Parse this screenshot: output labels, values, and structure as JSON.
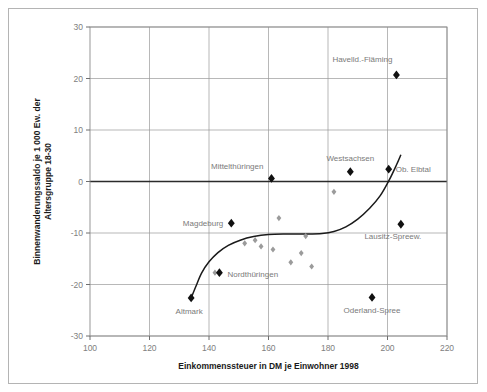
{
  "chart_data": {
    "type": "scatter",
    "title": "",
    "xlabel": "Einkommenssteuer in DM je Einwohner 1998",
    "ylabel": "Binnenwanderungssaldo je 1 000 Ew. der Altersgruppe 18-30",
    "xlim": [
      100,
      220
    ],
    "ylim": [
      -30,
      30
    ],
    "xticks": [
      100,
      120,
      140,
      160,
      180,
      200,
      220
    ],
    "yticks": [
      30,
      20,
      10,
      0,
      -10,
      -20,
      -30
    ],
    "grid": true,
    "legend": "none",
    "zero_line": 0,
    "series": [
      {
        "name": "labelled-regions",
        "marker": "filled-diamond-large",
        "color": "#111111",
        "points": [
          {
            "label": "Havelld.-Fläming",
            "x": 203.0,
            "y": 20.7,
            "label_dx": -4,
            "label_dy": -13,
            "label_anchor": "end"
          },
          {
            "label": "Ob. Elbtal",
            "x": 200.4,
            "y": 2.4,
            "label_dx": 7,
            "label_dy": 3,
            "label_anchor": "start"
          },
          {
            "label": "Westsachsen",
            "x": 187.5,
            "y": 1.9,
            "label_dx": 0,
            "label_dy": -11,
            "label_anchor": "middle"
          },
          {
            "label": "Mittelthüringen",
            "x": 161.0,
            "y": 0.6,
            "label_dx": -8,
            "label_dy": -9,
            "label_anchor": "end"
          },
          {
            "label": "Magdeburg",
            "x": 147.5,
            "y": -8.1,
            "label_dx": -8,
            "label_dy": 3,
            "label_anchor": "end"
          },
          {
            "label": "Lausitz-Spreew.",
            "x": 204.5,
            "y": -8.3,
            "label_dx": -8,
            "label_dy": 15,
            "label_anchor": "middle"
          },
          {
            "label": "Nordthüringen",
            "x": 143.5,
            "y": -17.7,
            "label_dx": 8,
            "label_dy": 4,
            "label_anchor": "start"
          },
          {
            "label": "Altmark",
            "x": 134.0,
            "y": -22.6,
            "label_dx": -2,
            "label_dy": 16,
            "label_anchor": "middle"
          },
          {
            "label": "Oderland-Spree",
            "x": 194.8,
            "y": -22.5,
            "label_dx": 0,
            "label_dy": 16,
            "label_anchor": "middle"
          }
        ]
      },
      {
        "name": "unlabelled-regions",
        "marker": "filled-diamond-small",
        "color": "#9b9b9b",
        "points": [
          {
            "x": 182.0,
            "y": -2.0
          },
          {
            "x": 163.5,
            "y": -7.1
          },
          {
            "x": 172.5,
            "y": -10.6
          },
          {
            "x": 152.0,
            "y": -12.0
          },
          {
            "x": 155.5,
            "y": -11.4
          },
          {
            "x": 157.5,
            "y": -12.6
          },
          {
            "x": 161.5,
            "y": -13.2
          },
          {
            "x": 171.0,
            "y": -13.9
          },
          {
            "x": 167.5,
            "y": -15.7
          },
          {
            "x": 174.5,
            "y": -16.5
          },
          {
            "x": 142.0,
            "y": -17.7
          }
        ]
      }
    ],
    "trend_line": {
      "name": "fitted-curve",
      "color": "#1a1a1a",
      "points": [
        {
          "x": 133.8,
          "y": -22.9
        },
        {
          "x": 135.5,
          "y": -20.5
        },
        {
          "x": 137.5,
          "y": -17.8
        },
        {
          "x": 140.0,
          "y": -15.6
        },
        {
          "x": 143.0,
          "y": -13.8
        },
        {
          "x": 146.5,
          "y": -12.4
        },
        {
          "x": 150.5,
          "y": -11.4
        },
        {
          "x": 155.0,
          "y": -10.7
        },
        {
          "x": 160.0,
          "y": -10.3
        },
        {
          "x": 166.0,
          "y": -10.2
        },
        {
          "x": 172.0,
          "y": -10.2
        },
        {
          "x": 178.0,
          "y": -10.1
        },
        {
          "x": 182.0,
          "y": -9.7
        },
        {
          "x": 186.0,
          "y": -8.8
        },
        {
          "x": 190.0,
          "y": -7.3
        },
        {
          "x": 194.0,
          "y": -5.2
        },
        {
          "x": 197.5,
          "y": -2.8
        },
        {
          "x": 200.5,
          "y": 0.2
        },
        {
          "x": 203.0,
          "y": 3.2
        },
        {
          "x": 204.5,
          "y": 5.2
        }
      ]
    }
  },
  "axis": {
    "x_title": "Einkommenssteuer in DM je Einwohner 1998",
    "y_title_line1": "Binnenwanderungssaldo je 1 000 Ew. der",
    "y_title_line2": "Altersgruppe 18-30"
  },
  "colors": {
    "major_marker": "#111111",
    "minor_marker": "#9b9b9b",
    "grid": "#9a9a9a",
    "zero_axis": "#2b2b2b",
    "frame": "#b4b4b4",
    "tick_text": "#808080",
    "label_text": "#7a7a7a"
  }
}
